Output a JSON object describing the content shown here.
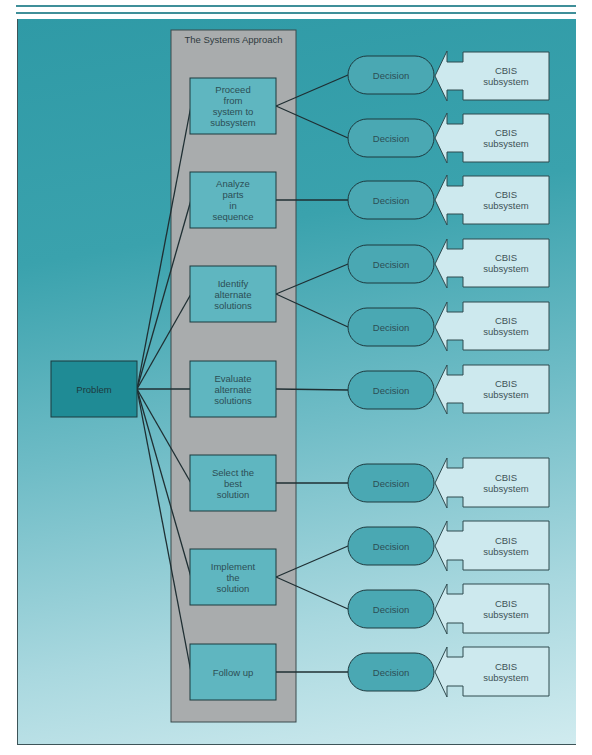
{
  "colors": {
    "panel_top": "#2f9aa6",
    "panel_bottom": "#d0ebef",
    "approach_panel": "#a9acad",
    "step_box": "#5fb6c0",
    "problem_box": "#1f8b95",
    "decision": "#4aa8b3",
    "cbis_box": "#cde9ee",
    "line": "#1f2f33"
  },
  "diagram": {
    "problem": {
      "label": "Problem"
    },
    "approach": {
      "title": "The Systems Approach",
      "steps": [
        {
          "label": "Proceed\nfrom\nsystem to\nsubsystem",
          "decisions": 2
        },
        {
          "label": "Analyze\nparts\nin\nsequence",
          "decisions": 1
        },
        {
          "label": "Identify\nalternate\nsolutions",
          "decisions": 2
        },
        {
          "label": "Evaluate\nalternate\nsolutions",
          "decisions": 1
        },
        {
          "label": "Select the\nbest\nsolution",
          "decisions": 1
        },
        {
          "label": "Implement\nthe\nsolution",
          "decisions": 2
        },
        {
          "label": "Follow up",
          "decisions": 1
        }
      ]
    },
    "decisions": [
      {
        "label": "Decision",
        "source": "CBIS\nsubsystem"
      },
      {
        "label": "Decision",
        "source": "CBIS\nsubsystem"
      },
      {
        "label": "Decision",
        "source": "CBIS\nsubsystem"
      },
      {
        "label": "Decision",
        "source": "CBIS\nsubsystem"
      },
      {
        "label": "Decision",
        "source": "CBIS\nsubsystem"
      },
      {
        "label": "Decision",
        "source": "CBIS\nsubsystem"
      },
      {
        "label": "Decision",
        "source": "CBIS\nsubsystem"
      },
      {
        "label": "Decision",
        "source": "CBIS\nsubsystem"
      },
      {
        "label": "Decision",
        "source": "CBIS\nsubsystem"
      },
      {
        "label": "Decision",
        "source": "CBIS\nsubsystem"
      }
    ]
  }
}
